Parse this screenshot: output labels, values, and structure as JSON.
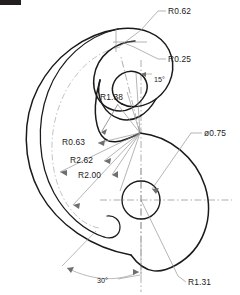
{
  "drawing": {
    "title": "Hook cam profile",
    "type": "mechanical-part-outline",
    "units": "inches",
    "line_color": "#1a1a1a",
    "centerline_color": "#9b9b9b",
    "leader_color": "#8c8c8c",
    "background": "#ffffff",
    "corner_mark": {
      "name": "corner-artifact",
      "x": 0,
      "y": 0,
      "width": 21,
      "height": 5,
      "color": "#231f20"
    }
  },
  "callouts": [
    {
      "id": "r062",
      "label": "R0.62",
      "text_x": 168,
      "text_y": 14,
      "anchor": "start"
    },
    {
      "id": "r025",
      "label": "R0.25",
      "text_x": 168,
      "text_y": 62,
      "anchor": "start"
    },
    {
      "id": "a15",
      "label": "15°",
      "text_x": 154,
      "text_y": 82,
      "anchor": "start"
    },
    {
      "id": "r138",
      "label": "R1.38",
      "text_x": 100,
      "text_y": 100,
      "anchor": "start"
    },
    {
      "id": "r063",
      "label": "R0.63",
      "text_x": 62,
      "text_y": 145,
      "anchor": "start"
    },
    {
      "id": "d075",
      "label": "ø0.75",
      "text_x": 204,
      "text_y": 136,
      "anchor": "start"
    },
    {
      "id": "r262",
      "label": "R2.62",
      "text_x": 70,
      "text_y": 163,
      "anchor": "start"
    },
    {
      "id": "r200",
      "label": "R2.00",
      "text_x": 78,
      "text_y": 178,
      "anchor": "start"
    },
    {
      "id": "a30",
      "label": "30°",
      "text_x": 97,
      "text_y": 283,
      "anchor": "start"
    },
    {
      "id": "r131",
      "label": "R1.31",
      "text_x": 188,
      "text_y": 285,
      "anchor": "start"
    }
  ],
  "dimension_values": {
    "R0_62": 0.62,
    "R0_25": 0.25,
    "R1_38": 1.38,
    "R0_63": 0.63,
    "R2_62": 2.62,
    "R2_00": 2.0,
    "R1_31": 1.31,
    "DIA_0_75": 0.75,
    "ANGLE_15": 15,
    "ANGLE_30": 30
  },
  "geometry": {
    "hub_center": {
      "x": 141,
      "y": 200
    },
    "hub_hole_radius": 19,
    "lobe_radius": 66,
    "cusp_point": {
      "x": 140,
      "y": 133
    }
  }
}
